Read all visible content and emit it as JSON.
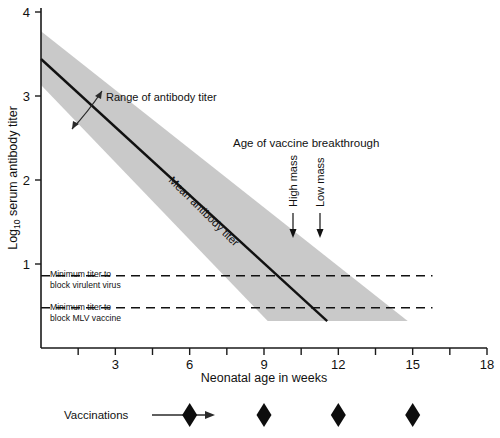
{
  "chart_data": {
    "type": "line",
    "title": "",
    "xlabel": "Neonatal age in weeks",
    "ylabel": "Log10 serum antibody titer",
    "ylabel_base": "Log",
    "ylabel_sub": "10",
    "ylabel_rest": " serum antibody titer",
    "xlim": [
      0,
      18
    ],
    "ylim": [
      0.3,
      4.15
    ],
    "xticks": [
      1.5,
      3,
      4.5,
      6,
      7.5,
      9,
      10.5,
      12,
      13.5,
      15,
      16.5,
      18
    ],
    "xtick_labels": [
      "",
      "3",
      "",
      "6",
      "",
      "9",
      "",
      "12",
      "",
      "15",
      "",
      "18"
    ],
    "yticks": [
      1,
      2,
      3,
      4
    ],
    "ytick_labels": [
      "1",
      "2",
      "3",
      "4"
    ],
    "grid": false,
    "legend_position": "none",
    "series": [
      {
        "name": "Mean antibody titer",
        "label": "Mean antibody titer",
        "x": [
          0,
          11.55
        ],
        "values": [
          3.44,
          0.32
        ]
      }
    ],
    "band": {
      "name": "Range of antibody titer",
      "label": "Range of antibody titer",
      "upper_x": [
        0,
        14.8
      ],
      "upper_values": [
        3.77,
        0.32
      ],
      "lower_x": [
        0,
        9.15
      ],
      "lower_values": [
        3.13,
        0.32
      ]
    },
    "thresholds": [
      {
        "name": "minimum-titer-virulent-virus",
        "label_line1": "Minimum titer to",
        "label_line2": "block virulent virus",
        "value": 0.86,
        "x_start": 0,
        "x_end": 15.8
      },
      {
        "name": "minimum-titer-mlv-vaccine",
        "label_line1": "Minimum titer to",
        "label_line2": "block MLV vaccine",
        "value": 0.48,
        "x_start": 0,
        "x_end": 15.8
      }
    ],
    "annotations": [
      {
        "name": "age-of-vaccine-breakthrough",
        "text": "Age of vaccine breakthrough",
        "x": 9.4,
        "y": 2.63
      },
      {
        "name": "high-mass-breakthrough",
        "text": "High mass",
        "x": 11.5,
        "y": 2.0
      },
      {
        "name": "low-mass-breakthrough",
        "text": "Low mass",
        "x": 12.7,
        "y": 2.0
      }
    ],
    "vaccinations": {
      "label": "Vaccinations",
      "marker": "diamond",
      "x": [
        6,
        9,
        12,
        15
      ]
    }
  },
  "colors": {
    "band_gray": "#c9c9c9",
    "line_black": "#111111",
    "background": "#ffffff"
  }
}
